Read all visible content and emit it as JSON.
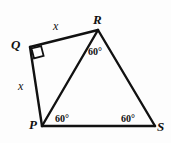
{
  "figure": {
    "type": "geometry-diagram",
    "stroke_color": "#111111",
    "background_color": "#fdfdfd",
    "stroke_width": 2,
    "vertices": [
      {
        "name": "Q",
        "label": "Q",
        "x": 30,
        "y": 47
      },
      {
        "name": "R",
        "label": "R",
        "x": 98,
        "y": 30
      },
      {
        "name": "P",
        "label": "P",
        "x": 42,
        "y": 126
      },
      {
        "name": "S",
        "label": "S",
        "x": 155,
        "y": 126
      }
    ],
    "segments": [
      {
        "name": "QR",
        "from": "Q",
        "to": "R"
      },
      {
        "name": "RS",
        "from": "R",
        "to": "S"
      },
      {
        "name": "PS",
        "from": "P",
        "to": "S"
      },
      {
        "name": "QP",
        "from": "Q",
        "to": "P"
      },
      {
        "name": "PR",
        "from": "P",
        "to": "R"
      }
    ],
    "side_labels": [
      {
        "name": "side-qr",
        "text": "x",
        "segment": "QR"
      },
      {
        "name": "side-qp",
        "text": "x",
        "segment": "QP"
      }
    ],
    "angle_labels": [
      {
        "name": "angle-r",
        "text": "60°",
        "vertex": "R"
      },
      {
        "name": "angle-p",
        "text": "60°",
        "vertex": "P"
      },
      {
        "name": "angle-s",
        "text": "60°",
        "vertex": "S"
      }
    ],
    "right_angle_marker": {
      "name": "right-angle-Q",
      "vertex": "Q",
      "measure": "90°"
    }
  }
}
